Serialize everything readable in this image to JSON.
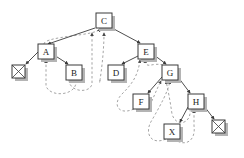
{
  "diagram": {
    "type": "tree-diagram",
    "background_color": "#ffffff",
    "node_fill": "#ffffff",
    "node_stroke": "#3a3a3a",
    "solid_edge_color": "#3a3a3a",
    "dashed_edge_color": "#9a9a9a",
    "nodes": [
      {
        "id": "C",
        "label": "C",
        "x": 96,
        "y": 13,
        "w": 16,
        "h": 15,
        "kind": "labeled"
      },
      {
        "id": "A",
        "label": "A",
        "x": 38,
        "y": 44,
        "w": 16,
        "h": 15,
        "kind": "labeled"
      },
      {
        "id": "E",
        "label": "E",
        "x": 138,
        "y": 44,
        "w": 16,
        "h": 15,
        "kind": "labeled"
      },
      {
        "id": "NIL1",
        "label": "",
        "x": 12,
        "y": 65,
        "w": 13,
        "h": 13,
        "kind": "nil"
      },
      {
        "id": "B",
        "label": "B",
        "x": 66,
        "y": 65,
        "w": 16,
        "h": 15,
        "kind": "labeled"
      },
      {
        "id": "D",
        "label": "D",
        "x": 108,
        "y": 65,
        "w": 16,
        "h": 15,
        "kind": "labeled"
      },
      {
        "id": "G",
        "label": "G",
        "x": 162,
        "y": 65,
        "w": 16,
        "h": 15,
        "kind": "labeled"
      },
      {
        "id": "F",
        "label": "F",
        "x": 133,
        "y": 94,
        "w": 16,
        "h": 15,
        "kind": "labeled"
      },
      {
        "id": "H",
        "label": "H",
        "x": 188,
        "y": 94,
        "w": 16,
        "h": 15,
        "kind": "labeled"
      },
      {
        "id": "X",
        "label": "X",
        "x": 164,
        "y": 124,
        "w": 16,
        "h": 15,
        "kind": "labeled"
      },
      {
        "id": "NIL2",
        "label": "",
        "x": 212,
        "y": 120,
        "w": 13,
        "h": 13,
        "kind": "nil"
      }
    ],
    "child_edges": [
      {
        "from": "C",
        "to": "A"
      },
      {
        "from": "C",
        "to": "E"
      },
      {
        "from": "A",
        "to": "NIL1"
      },
      {
        "from": "A",
        "to": "B"
      },
      {
        "from": "E",
        "to": "D"
      },
      {
        "from": "E",
        "to": "G"
      },
      {
        "from": "G",
        "to": "F"
      },
      {
        "from": "G",
        "to": "H"
      },
      {
        "from": "H",
        "to": "X"
      },
      {
        "from": "H",
        "to": "NIL2"
      }
    ],
    "parent_edges": [
      {
        "from": "A",
        "to": "C"
      },
      {
        "from": "B",
        "to": "C"
      },
      {
        "from": "B",
        "to": "A"
      },
      {
        "from": "D",
        "to": "E"
      },
      {
        "from": "F",
        "to": "E"
      },
      {
        "from": "G",
        "to": "E"
      },
      {
        "from": "F",
        "to": "G"
      },
      {
        "from": "H",
        "to": "G"
      },
      {
        "from": "X",
        "to": "G"
      },
      {
        "from": "X",
        "to": "H"
      }
    ]
  }
}
